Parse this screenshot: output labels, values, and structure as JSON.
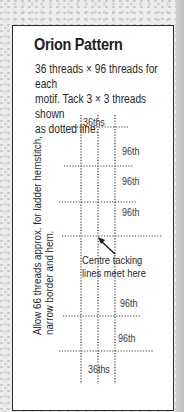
{
  "panel": {
    "title": "Orion Pattern",
    "description_lines": [
      "36 threads × 96 threads for each",
      "motif. Tack 3 × 3 threads shown",
      "as dotted line."
    ]
  },
  "diagram": {
    "top_label": "36ths",
    "bottom_label": "36ths",
    "row_labels": [
      "96th",
      "96th",
      "96th",
      "96th",
      "96th"
    ],
    "centre_note": [
      "Centre tacking",
      "lines meet here"
    ],
    "side_note": [
      "Allow 66 threads approx. for ladder hemstitch,",
      "narrow border and hem."
    ],
    "line_color": "#3a3a3a"
  }
}
